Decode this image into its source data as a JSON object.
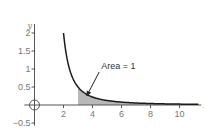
{
  "chart_data": {
    "type": "line",
    "title": "",
    "xlabel": "x",
    "ylabel": "y",
    "xlim": [
      -0.2,
      11.5
    ],
    "ylim": [
      -0.55,
      2.25
    ],
    "grid": false,
    "legend": "none",
    "x_ticks": [
      2,
      4,
      6,
      8,
      10
    ],
    "x_tick_labels": [
      "2",
      "4",
      "6",
      "8",
      "10"
    ],
    "y_ticks": [
      -0.5,
      0.5,
      1,
      1.5,
      2
    ],
    "y_tick_labels": [
      "−0.5",
      "0.5",
      "1",
      "1.5",
      "2"
    ],
    "series": [
      {
        "name": "f(x) = 2/(x-1)^2",
        "x_start": 2,
        "x_end": 11.3,
        "points": [
          [
            2,
            2.0
          ],
          [
            2.5,
            0.889
          ],
          [
            3,
            0.5
          ],
          [
            3.5,
            0.32
          ],
          [
            4,
            0.222
          ],
          [
            5,
            0.125
          ],
          [
            6,
            0.08
          ],
          [
            7,
            0.056
          ],
          [
            8,
            0.041
          ],
          [
            9,
            0.031
          ],
          [
            10,
            0.025
          ],
          [
            11,
            0.02
          ]
        ],
        "color": "#1a1a1a"
      }
    ],
    "shaded_region": {
      "x_from": 3,
      "x_to": 11.3,
      "under": "f(x) = 2/(x-1)^2",
      "color": "#b8b8b8"
    },
    "annotations": [
      {
        "text": "Area = 1",
        "arrow_to": [
          3.6,
          0.25
        ],
        "text_at": [
          4.6,
          1.0
        ]
      }
    ],
    "origin_marker": "circle-crosshair"
  }
}
